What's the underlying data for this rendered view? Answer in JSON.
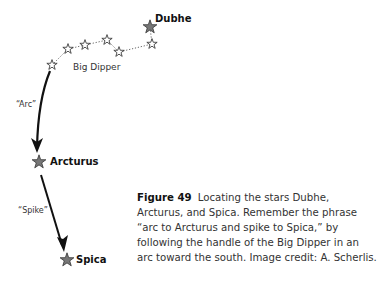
{
  "diagram": {
    "labels": {
      "dubhe": "Dubhe",
      "big_dipper": "Big Dipper",
      "arc": "“Arc”",
      "arcturus": "Arcturus",
      "spike": "“Spike”",
      "spica": "Spica"
    },
    "stars": [
      {
        "name": "handle-end",
        "x": 52,
        "y": 65,
        "type": "outline"
      },
      {
        "name": "handle-2",
        "x": 68,
        "y": 49,
        "type": "outline"
      },
      {
        "name": "handle-3",
        "x": 85,
        "y": 45,
        "type": "outline"
      },
      {
        "name": "bowl-1",
        "x": 107,
        "y": 40,
        "type": "outline"
      },
      {
        "name": "bowl-2",
        "x": 119,
        "y": 52,
        "type": "outline"
      },
      {
        "name": "bowl-3",
        "x": 152,
        "y": 44,
        "type": "outline"
      },
      {
        "name": "dubhe",
        "x": 150,
        "y": 27,
        "type": "filled"
      },
      {
        "name": "arcturus",
        "x": 39,
        "y": 162,
        "type": "filled"
      },
      {
        "name": "spica",
        "x": 67,
        "y": 260,
        "type": "filled"
      }
    ]
  },
  "caption": {
    "figure_label": "Figure 49",
    "text": "Locating the stars Dubhe, Arcturus, and Spica. Remember the phrase “arc to Arcturus and spike to Spica,” by following the handle of the Big Dipper in an arc toward the south. Image credit: A. Scherlis."
  }
}
